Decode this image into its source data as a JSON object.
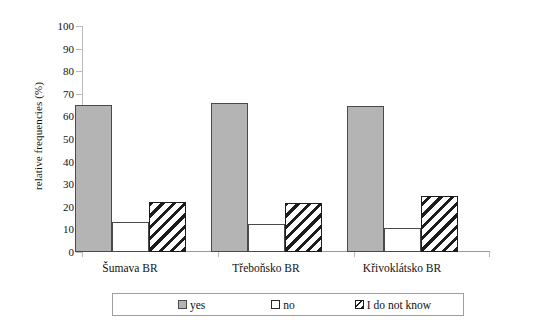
{
  "chart_data": {
    "type": "bar",
    "title": "",
    "subtitle": "",
    "xlabel": "",
    "ylabel": "relative frequencies (%)",
    "ylim": [
      0,
      100
    ],
    "ytick_labels": [
      "100",
      "90",
      "80",
      "70",
      "60",
      "50",
      "40",
      "30",
      "20",
      "10",
      "0"
    ],
    "ytick_values": [
      100,
      90,
      80,
      70,
      60,
      50,
      40,
      30,
      20,
      10,
      0
    ],
    "grid": false,
    "legend_position": "bottom",
    "categories": [
      "Šumava BR",
      "Třeboňsko BR",
      "Křivoklátsko BR"
    ],
    "series": [
      {
        "name": "yes",
        "values": [
          65,
          66,
          64.5
        ],
        "fill": "solid-gray",
        "color": "#b4b4b4"
      },
      {
        "name": "no",
        "values": [
          13.5,
          12.5,
          10.5
        ],
        "fill": "white",
        "color": "#ffffff"
      },
      {
        "name": "I do not know",
        "values": [
          22,
          21.5,
          25
        ],
        "fill": "diagonal-hatch",
        "color": "#1c1c1c"
      }
    ]
  },
  "legend": {
    "items": [
      {
        "label": "yes",
        "swatch": "solid-gray-swatch"
      },
      {
        "label": "no",
        "swatch": "white-swatch"
      },
      {
        "label": "I do not know",
        "swatch": "hatched-swatch"
      }
    ]
  },
  "colors": {
    "bar_fill_yes": "#b4b4b4",
    "bar_edge": "#4a4a4a",
    "hatch_color": "#1c1c1c",
    "axis": "#b9b9b9",
    "background": "#ffffff",
    "text": "#111111"
  }
}
